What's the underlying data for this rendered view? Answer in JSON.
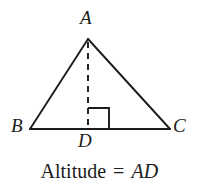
{
  "figure": {
    "type": "geometry-diagram",
    "background_color": "#ffffff",
    "stroke_color": "#1c1c1c",
    "canvas": {
      "width": 199,
      "height": 194
    }
  },
  "labels": {
    "apex": "A",
    "base_left": "B",
    "base_right": "C",
    "foot": "D"
  },
  "caption": {
    "prefix": "Altitude",
    "equals": "=",
    "segment": "AD",
    "full_text": "Altitude = AD"
  },
  "geometry": {
    "points": {
      "A": {
        "x": 88,
        "y": 39
      },
      "B": {
        "x": 30,
        "y": 129
      },
      "C": {
        "x": 170,
        "y": 129
      },
      "D": {
        "x": 88,
        "y": 129
      }
    },
    "segments": [
      {
        "name": "side-AB",
        "from": "A",
        "to": "B",
        "style": "solid"
      },
      {
        "name": "side-AC",
        "from": "A",
        "to": "C",
        "style": "solid"
      },
      {
        "name": "base-BC",
        "from": "B",
        "to": "C",
        "style": "solid"
      },
      {
        "name": "altitude-AD",
        "from": "A",
        "to": "D",
        "style": "dashed"
      }
    ],
    "right_angle_marker": {
      "at": "D",
      "size": 21,
      "orientation": "right-of-altitude"
    },
    "stroke_width": 1.9,
    "dash_pattern": "6 5"
  }
}
